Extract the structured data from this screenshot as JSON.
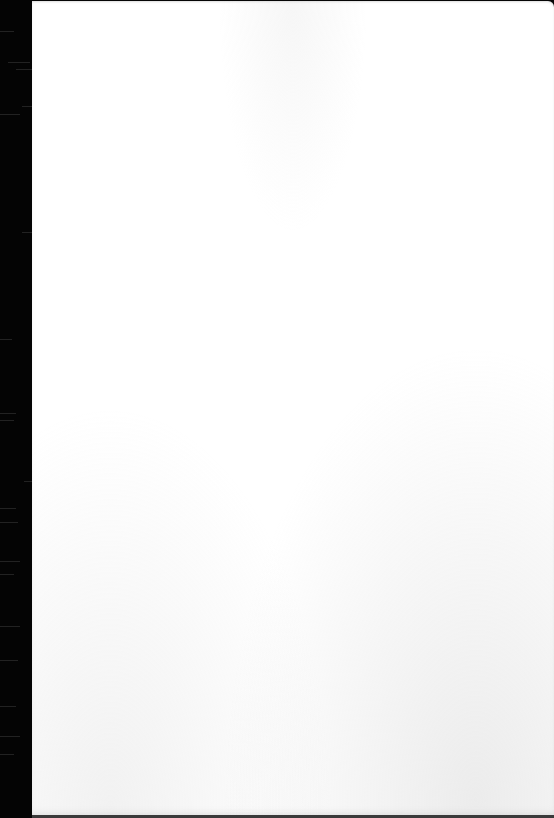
{
  "scene": {
    "description": "Blank white sheet of paper on dark background",
    "colors": {
      "background": "#050505",
      "paper": "#ffffff",
      "edge_shadow": "#3a3a3a"
    }
  }
}
